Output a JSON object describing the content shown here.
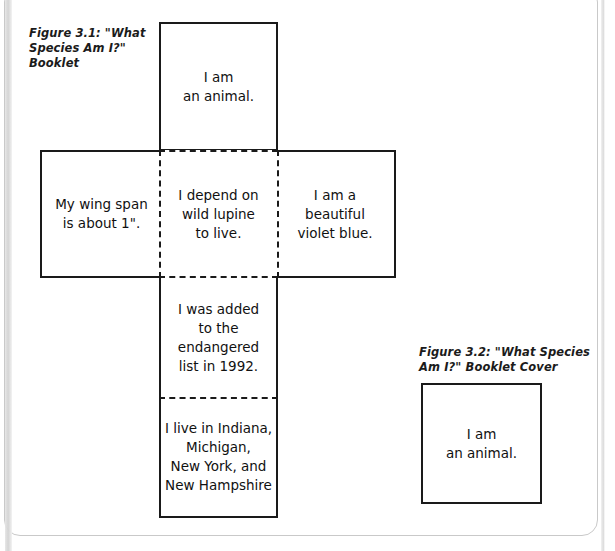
{
  "figure_3_1": {
    "caption": "Figure 3.1: \"What Species Am I?\" Booklet",
    "panels": {
      "top": "I am\nan animal.",
      "left": "My wing span\nis about 1\".",
      "center": "I depend on\nwild lupine\nto live.",
      "right": "I am a\nbeautiful\nviolet blue.",
      "lower_middle": "I was added\nto the\nendangered\nlist in 1992.",
      "bottom": "I live in Indiana,\nMichigan,\nNew York, and\nNew Hampshire"
    }
  },
  "figure_3_2": {
    "caption": "Figure 3.2: \"What Species Am I?\" Booklet Cover",
    "cover_text": "I am\nan animal."
  },
  "colors": {
    "ink": "#1a1a1a",
    "paper": "#ffffff",
    "frame": "#c9c9c9"
  }
}
